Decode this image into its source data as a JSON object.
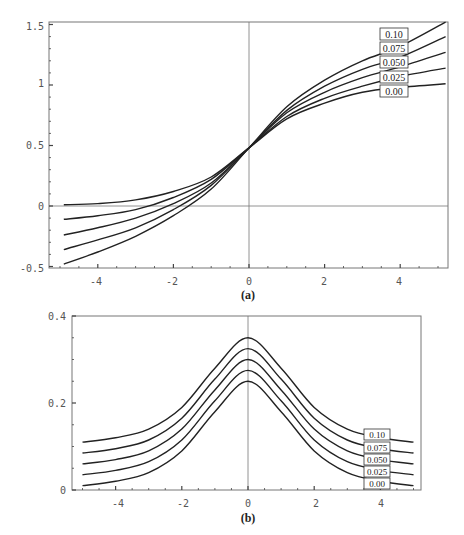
{
  "chart_data": [
    {
      "type": "line",
      "caption": "(a)",
      "title": "",
      "xlabel": "",
      "ylabel": "",
      "xlim": [
        -5.3,
        5.2
      ],
      "ylim": [
        -0.5,
        1.5
      ],
      "x_ticks": [
        "-4",
        "-2",
        "0",
        "2",
        "4"
      ],
      "y_ticks": [
        "-0.5",
        "0",
        "0.5",
        "1",
        "1.5"
      ],
      "grid": false,
      "legend_position": "boxed labels at right end of curves",
      "x": [
        -4.9,
        -4,
        -3,
        -2,
        -1,
        0,
        1,
        2,
        3,
        4,
        5.2
      ],
      "series": [
        {
          "name": "0.00",
          "values": [
            0.01,
            0.02,
            0.05,
            0.12,
            0.24,
            0.48,
            0.72,
            0.85,
            0.94,
            0.98,
            1.01
          ]
        },
        {
          "name": "0.025",
          "values": [
            -0.11,
            -0.08,
            -0.03,
            0.07,
            0.22,
            0.48,
            0.74,
            0.89,
            0.99,
            1.07,
            1.14
          ]
        },
        {
          "name": "0.050",
          "values": [
            -0.24,
            -0.18,
            -0.1,
            0.02,
            0.19,
            0.48,
            0.77,
            0.94,
            1.06,
            1.15,
            1.27
          ]
        },
        {
          "name": "0.075",
          "values": [
            -0.36,
            -0.28,
            -0.18,
            -0.03,
            0.17,
            0.48,
            0.79,
            0.99,
            1.13,
            1.23,
            1.4
          ]
        },
        {
          "name": "0.10",
          "values": [
            -0.48,
            -0.38,
            -0.25,
            -0.08,
            0.14,
            0.48,
            0.82,
            1.04,
            1.2,
            1.32,
            1.52
          ]
        }
      ]
    },
    {
      "type": "line",
      "caption": "(b)",
      "title": "",
      "xlabel": "",
      "ylabel": "",
      "xlim": [
        -5.3,
        5.2
      ],
      "ylim": [
        0,
        0.4
      ],
      "x_ticks": [
        "-4",
        "-2",
        "0",
        "2",
        "4"
      ],
      "y_ticks": [
        "0",
        "0.2",
        "0.4"
      ],
      "grid": false,
      "legend_position": "boxed labels at right end of curves",
      "x": [
        -5,
        -4,
        -3,
        -2,
        -1,
        0,
        1,
        2,
        3,
        4,
        5
      ],
      "series": [
        {
          "name": "0.00",
          "values": [
            0.01,
            0.02,
            0.04,
            0.09,
            0.18,
            0.25,
            0.18,
            0.09,
            0.04,
            0.02,
            0.01
          ]
        },
        {
          "name": "0.025",
          "values": [
            0.035,
            0.045,
            0.065,
            0.115,
            0.205,
            0.275,
            0.205,
            0.115,
            0.065,
            0.045,
            0.035
          ]
        },
        {
          "name": "0.050",
          "values": [
            0.06,
            0.07,
            0.09,
            0.14,
            0.23,
            0.3,
            0.23,
            0.14,
            0.09,
            0.07,
            0.06
          ]
        },
        {
          "name": "0.075",
          "values": [
            0.085,
            0.095,
            0.115,
            0.165,
            0.255,
            0.325,
            0.255,
            0.165,
            0.115,
            0.095,
            0.085
          ]
        },
        {
          "name": "0.10",
          "values": [
            0.11,
            0.12,
            0.14,
            0.19,
            0.28,
            0.35,
            0.28,
            0.19,
            0.14,
            0.12,
            0.11
          ]
        }
      ]
    }
  ],
  "plots": {
    "a": {
      "caption": "(a)",
      "x_tick_labels": [
        "-4",
        "-2",
        "0",
        "2",
        "4"
      ],
      "y_tick_labels": [
        "1.5",
        "1",
        "0.5",
        "0",
        "-0.5"
      ],
      "curve_labels": [
        "0.10",
        "0.075",
        "0.050",
        "0.025",
        "0.00"
      ],
      "line_color": "#222222",
      "frame_color": "#777777"
    },
    "b": {
      "caption": "(b)",
      "x_tick_labels": [
        "-4",
        "-2",
        "0",
        "2",
        "4"
      ],
      "y_tick_labels": [
        "0.4",
        "0.2",
        "0"
      ],
      "curve_labels": [
        "0.10",
        "0.075",
        "0.050",
        "0.025",
        "0.00"
      ],
      "line_color": "#222222",
      "frame_color": "#777777"
    }
  }
}
